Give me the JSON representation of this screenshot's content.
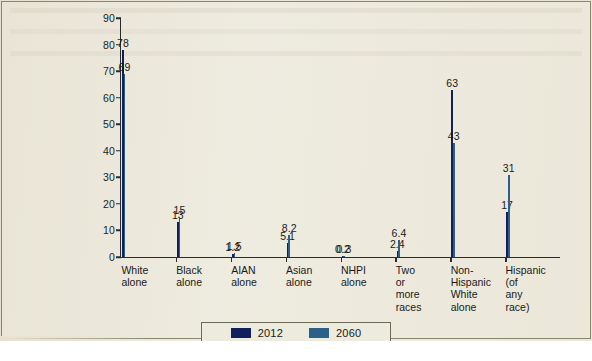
{
  "chart_data": {
    "type": "bar",
    "title": "",
    "subtitle": "",
    "xlabel": "",
    "ylabel": "",
    "ylim": [
      0,
      90
    ],
    "yticks": [
      0,
      10,
      20,
      30,
      40,
      50,
      60,
      70,
      80,
      90
    ],
    "grid": false,
    "legend_position": "bottom-center",
    "categories": [
      "White\nalone",
      "Black\nalone",
      "AIAN\nalone",
      "Asian\nalone",
      "NHPI\nalone",
      "Two or\nmore\nraces",
      "Non-\nHispanic\nWhite\nalone",
      "Hispanic\n(of any\nrace)"
    ],
    "series": [
      {
        "name": "2012",
        "color": "#11205c",
        "values": [
          78,
          13,
          1.2,
          5.1,
          0.2,
          2.4,
          63,
          17
        ],
        "labels": [
          "78",
          "13",
          "1.2",
          "5.1",
          "0.2",
          "2.4",
          "63",
          "17"
        ]
      },
      {
        "name": "2060",
        "color": "#2d6089",
        "values": [
          69,
          15,
          1.5,
          8.2,
          0.3,
          6.4,
          43,
          31
        ],
        "labels": [
          "69",
          "15",
          "1.5",
          "8.2",
          "0.3",
          "6.4",
          "43",
          "31"
        ]
      }
    ]
  },
  "legend": {
    "items": [
      {
        "label": "2012",
        "color": "#11205c",
        "swatch": "legend-swatch-2012"
      },
      {
        "label": "2060",
        "color": "#2d6089",
        "swatch": "legend-swatch-2060"
      }
    ]
  },
  "colors": {
    "series_2012": "#11205c",
    "series_2060": "#2d6089",
    "paper_background": "#edeade",
    "axis": "#2b2b28",
    "text": "#1b1915"
  }
}
